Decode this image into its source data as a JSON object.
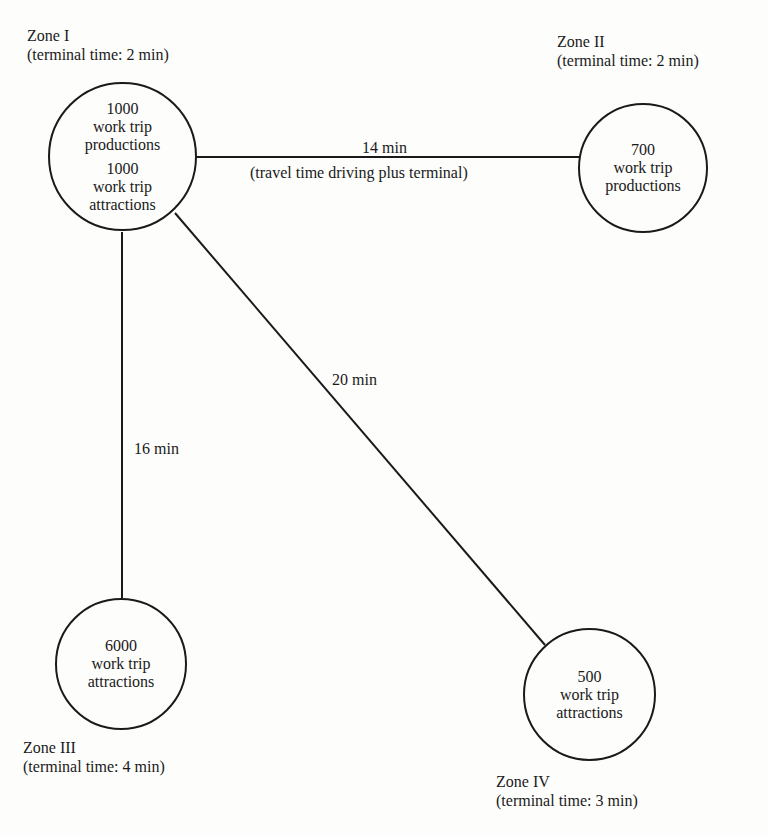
{
  "diagram": {
    "type": "trip-distribution-network",
    "zones": [
      {
        "id": "I",
        "name": "Zone I",
        "terminal_time": "(terminal time:  2 min)",
        "blocks": [
          {
            "value": "1000",
            "line1": "work trip",
            "line2": "productions"
          },
          {
            "value": "1000",
            "line1": "work trip",
            "line2": "attractions"
          }
        ]
      },
      {
        "id": "II",
        "name": "Zone II",
        "terminal_time": "(terminal time:  2 min)",
        "blocks": [
          {
            "value": "700",
            "line1": "work trip",
            "line2": "productions"
          }
        ]
      },
      {
        "id": "III",
        "name": "Zone III",
        "terminal_time": "(terminal time:  4 min)",
        "blocks": [
          {
            "value": "6000",
            "line1": "work trip",
            "line2": "attractions"
          }
        ]
      },
      {
        "id": "IV",
        "name": "Zone IV",
        "terminal_time": "(terminal time:  3 min)",
        "blocks": [
          {
            "value": "500",
            "line1": "work trip",
            "line2": "attractions"
          }
        ]
      }
    ],
    "links": [
      {
        "from": "I",
        "to": "II",
        "label": "14 min",
        "sublabel": "(travel time driving plus terminal)"
      },
      {
        "from": "I",
        "to": "III",
        "label": "16 min"
      },
      {
        "from": "I",
        "to": "IV",
        "label": "20 min"
      }
    ],
    "colors": {
      "stroke": "#1a1a1a",
      "background": "#fdfdfc"
    }
  }
}
